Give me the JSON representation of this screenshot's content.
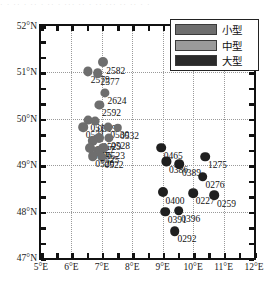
{
  "top_strip": "· ·   ··    · ·· · ·· · ··· ·· · ··  ··· ·· ·· · ·",
  "legend": {
    "items": [
      {
        "label": "小型",
        "color": "#6e6e6e",
        "name": "legend-small"
      },
      {
        "label": "中型",
        "color": "#9a9a9a",
        "name": "legend-medium"
      },
      {
        "label": "大型",
        "color": "#2a2a2a",
        "name": "legend-large"
      }
    ]
  },
  "axes": {
    "x_ticks": [
      "5°E",
      "6°E",
      "7°E",
      "8°E",
      "9°E",
      "10°E",
      "11°E",
      "12°E"
    ],
    "y_ticks": [
      "52°N",
      "51°N",
      "50°N",
      "49°N",
      "48°N",
      "47°N"
    ]
  },
  "chart_data": {
    "type": "scatter",
    "title": "",
    "xlabel": "",
    "ylabel": "",
    "xlim": [
      5,
      12
    ],
    "ylim": [
      47,
      52
    ],
    "grid": true,
    "legend_position": "top-right",
    "series": [
      {
        "name": "小型",
        "color": "#6e6e6e",
        "points": [
          {
            "label": "2582",
            "x": 7.05,
            "y": 51.22,
            "r": 5.0
          },
          {
            "label": "2579",
            "x": 6.55,
            "y": 51.02,
            "r": 4.6
          },
          {
            "label": "2577",
            "x": 6.87,
            "y": 50.98,
            "r": 4.8
          },
          {
            "label": "2624",
            "x": 7.1,
            "y": 50.55,
            "r": 4.6
          },
          {
            "label": "2592",
            "x": 6.92,
            "y": 50.3,
            "r": 4.6
          },
          {
            "label": "0516",
            "x": 6.55,
            "y": 49.97,
            "r": 4.4
          },
          {
            "label": "0519",
            "x": 6.78,
            "y": 49.95,
            "r": 4.4
          },
          {
            "label": "0531",
            "x": 6.38,
            "y": 49.82,
            "r": 4.8
          },
          {
            "label": "0530",
            "x": 7.2,
            "y": 49.82,
            "r": 4.4
          },
          {
            "label": "0532",
            "x": 7.52,
            "y": 49.8,
            "r": 4.2
          },
          {
            "label": "0529",
            "x": 6.92,
            "y": 49.58,
            "r": 5.0
          },
          {
            "label": "0528",
            "x": 7.22,
            "y": 49.58,
            "r": 4.6
          },
          {
            "label": "0527",
            "x": 6.7,
            "y": 49.52,
            "r": 5.2
          },
          {
            "label": "0523",
            "x": 7.05,
            "y": 49.38,
            "r": 4.8
          },
          {
            "label": "0526",
            "x": 6.62,
            "y": 49.38,
            "r": 5.0
          },
          {
            "label": "0525",
            "x": 6.86,
            "y": 49.3,
            "r": 4.8
          },
          {
            "label": "0522",
            "x": 7.0,
            "y": 49.18,
            "r": 4.6
          },
          {
            "label": "0520",
            "x": 6.7,
            "y": 49.2,
            "r": 4.8
          }
        ]
      },
      {
        "name": "大型",
        "color": "#1f1f1f",
        "points": [
          {
            "label": "0465",
            "x": 8.95,
            "y": 49.38,
            "r": 4.8
          },
          {
            "label": "1275",
            "x": 10.4,
            "y": 49.18,
            "r": 4.8
          },
          {
            "label": "0386",
            "x": 9.12,
            "y": 49.08,
            "r": 4.6
          },
          {
            "label": "0389",
            "x": 9.55,
            "y": 49.02,
            "r": 4.8
          },
          {
            "label": "0276",
            "x": 10.32,
            "y": 48.75,
            "r": 4.8
          },
          {
            "label": "0400",
            "x": 9.0,
            "y": 48.42,
            "r": 5.0
          },
          {
            "label": "0227",
            "x": 10.0,
            "y": 48.4,
            "r": 4.8
          },
          {
            "label": "0259",
            "x": 10.7,
            "y": 48.35,
            "r": 4.8
          },
          {
            "label": "0391",
            "x": 9.08,
            "y": 48.0,
            "r": 4.8
          },
          {
            "label": "0396",
            "x": 9.52,
            "y": 48.02,
            "r": 4.8
          },
          {
            "label": "0292",
            "x": 9.4,
            "y": 47.58,
            "r": 4.8
          }
        ]
      }
    ]
  }
}
